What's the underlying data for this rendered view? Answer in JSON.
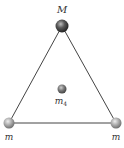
{
  "diagram": {
    "type": "equilateral-triangle-mass-arrangement",
    "masses": [
      {
        "id": "top",
        "label": "M",
        "subscript": "",
        "position": "top-vertex",
        "shade": "dark"
      },
      {
        "id": "bottom-left",
        "label": "m",
        "subscript": "",
        "position": "bottom-left-vertex",
        "shade": "light"
      },
      {
        "id": "bottom-right",
        "label": "m",
        "subscript": "",
        "position": "bottom-right-vertex",
        "shade": "light"
      },
      {
        "id": "center",
        "label": "m",
        "subscript": "4",
        "position": "centroid",
        "shade": "medium"
      }
    ],
    "colors": {
      "edge": "#444444",
      "dark_sphere": "#3a3a3a",
      "light_sphere": "#9a9a9a",
      "medium_sphere": "#666666"
    }
  }
}
